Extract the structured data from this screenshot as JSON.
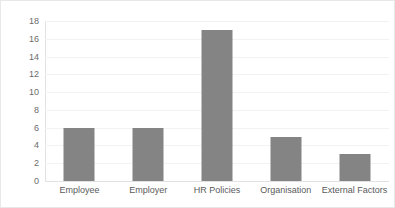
{
  "chart_data": {
    "type": "bar",
    "title": "",
    "subtitle": "",
    "xlabel": "",
    "ylabel": "",
    "categories": [
      "Employee",
      "Employer",
      "HR Policies",
      "Organisation",
      "External Factors"
    ],
    "values": [
      6,
      6,
      17,
      5,
      3
    ],
    "series": [
      {
        "name": "Series 1",
        "values": [
          6,
          6,
          17,
          5,
          3
        ]
      }
    ],
    "ylim": [
      0,
      18
    ],
    "ytick_values": [
      0,
      2,
      4,
      6,
      8,
      10,
      12,
      14,
      16,
      18
    ],
    "ytick_labels": [
      "0",
      "2",
      "4",
      "6",
      "8",
      "10",
      "12",
      "14",
      "16",
      "18"
    ],
    "ytick_step": 2,
    "grid": true,
    "grid_axis": "y",
    "legend": false,
    "legend_position": "none",
    "annotations": [],
    "colors": {
      "bar": "#848484",
      "gridline": "#f2f2f2",
      "axis": "#e2e2e2",
      "tick_label": "#6b6b6b",
      "category_label": "#5a5a5a",
      "background": "#ffffff",
      "border": "#e8e8e8"
    }
  }
}
